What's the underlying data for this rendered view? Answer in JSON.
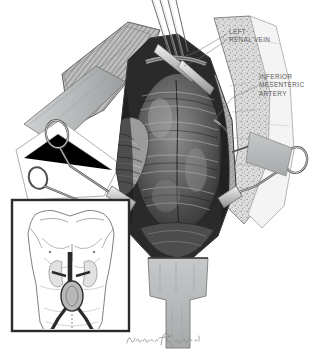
{
  "figure": {
    "kind": "medical-illustration",
    "medium": "pen and ink / graphite wash, grayscale",
    "background_color": "#ffffff",
    "width": 324,
    "height": 355
  },
  "annotations": [
    {
      "id": "left-renal-vein",
      "text": "LEFT\nRENAL VEIN",
      "lines": [
        "LEFT",
        "RENAL VEIN"
      ],
      "x": 229,
      "y": 28,
      "color": "#5a5a5a",
      "leader_lines": 2
    },
    {
      "id": "inferior-mesenteric-artery",
      "text": "INFERIOR\nMESENTERIC\nARTERY",
      "lines": [
        "INFERIOR",
        "MESENTERIC",
        "ARTERY"
      ],
      "x": 259,
      "y": 73,
      "color": "#5a5a5a",
      "leader_lines": 1
    }
  ],
  "inset": {
    "id": "orientation-inset",
    "description": "male torso, anterior view, showing kidneys, aorta and aortic aneurysm with iliac bifurcation",
    "frame": {
      "x": 12,
      "y": 200,
      "width": 117,
      "height": 131
    },
    "border_color": "#2b2b2b",
    "fill_color": "#ffffff"
  },
  "signature": {
    "id": "artist-signature",
    "style": "cursive handwritten, illegible at this resolution",
    "color": "#8a8a8a",
    "x": 126,
    "y": 332
  },
  "palette": {
    "ink": "#2b2b2b",
    "label_gray": "#5a5a5a",
    "drape_gray": "#b9bbbc",
    "drape_gray_dark": "#9a9d9f",
    "tissue_dark": "#3a3a3a",
    "tissue_mid": "#6e6e6e",
    "tissue_light": "#c9c9c9",
    "fat_gray": "#d0d0d0",
    "instrument_gray": "#cfcfcf",
    "shadow": "#1a1a1a",
    "white": "#ffffff"
  },
  "elements": [
    {
      "id": "aneurysm-sac",
      "label": "abdominal aortic aneurysm sac"
    },
    {
      "id": "retractor-left",
      "label": "ring-handled surgical retractor, left"
    },
    {
      "id": "retractor-right",
      "label": "ring-handled surgical retractor, right"
    },
    {
      "id": "bowel-loop",
      "label": "retracted bowel / duodenum"
    },
    {
      "id": "retroperitoneal-fat",
      "label": "retroperitoneal fat"
    },
    {
      "id": "surgical-drape-upper",
      "label": "surgical drape, upper"
    },
    {
      "id": "surgical-drape-lower",
      "label": "surgical drape, lower"
    },
    {
      "id": "forceps",
      "label": "forceps / instrument tips at superior field"
    }
  ]
}
